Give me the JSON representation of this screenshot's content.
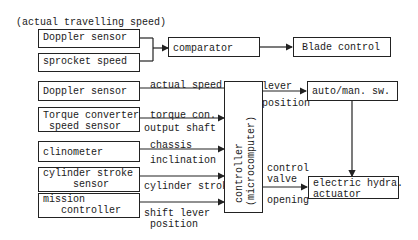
{
  "diagram": {
    "top_label": "(actual travelling speed)",
    "top_section": {
      "doppler_sensor": "Doppler sensor",
      "sprocket_speed": "sprocket speed",
      "comparator": "comparator",
      "blade_control": "Blade control"
    },
    "inputs": [
      {
        "box": "Doppler sensor",
        "signal": "actual speed"
      },
      {
        "box": "Torque converter\n speed sensor",
        "signal_top": "torque con.",
        "signal_bottom": "output shaft"
      },
      {
        "box": "clinometer",
        "signal_top": "chassis",
        "signal_bottom": "inclination"
      },
      {
        "box": "cylinder stroke\n     sensor",
        "signal": "cylinder stroke"
      },
      {
        "box": "mission\n   controller",
        "signal_top": "",
        "signal_bottom": "shift lever\n position"
      }
    ],
    "controller": {
      "line1": "controller",
      "line2": "(microcomputer)"
    },
    "outputs": {
      "lever_label": "lever",
      "position_label": "position",
      "auto_man_sw": "auto/man. sw.",
      "control_valve_label": "control\nvalve",
      "opening_label": "opening",
      "actuator": "electric hydra.\nactuator"
    }
  }
}
